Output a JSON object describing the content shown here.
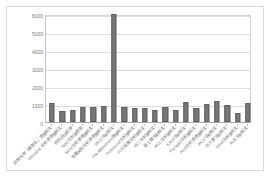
{
  "chart_data": {
    "type": "bar",
    "title": "",
    "subtitle": "",
    "xlabel": "",
    "ylabel": "",
    "ylim": [
      0,
      6000
    ],
    "yticks": [
      "0",
      "1000",
      "2000",
      "3000",
      "4000",
      "5000",
      "6000"
    ],
    "grid": true,
    "legend": null,
    "bar_color": "#777777",
    "plot_background": "#ffffff",
    "gridline_color": "#dcdcdc",
    "axis_color": "#a8a8a8",
    "categories": [
      "药物名称「通用名」使用频次",
      "lidocaine 注射液使用频次",
      "阿托品注射液",
      "Nacl注射液使用",
      "MCV注射液使用频次",
      "地塞米松注射液使用频次",
      "MCV注射频次",
      "FN-ABsorbent使用频次",
      "Pefuwood注射液频次",
      "PCP盐酸注射液频次",
      "HCl 注射液频次",
      "肾上腺注射频次",
      "MCL注射液频次",
      "Kmol注射频次",
      "FN-Nacl注射液频次",
      "Aocl注射液使用频次",
      "MCV注射频次",
      "白介素注射频次",
      "Smol注射液频次",
      "ALB注射频次"
    ],
    "values": [
      1080,
      620,
      640,
      840,
      860,
      900,
      6000,
      820,
      780,
      800,
      640,
      860,
      660,
      1120,
      780,
      980,
      1150,
      960,
      520,
      1060
    ]
  }
}
